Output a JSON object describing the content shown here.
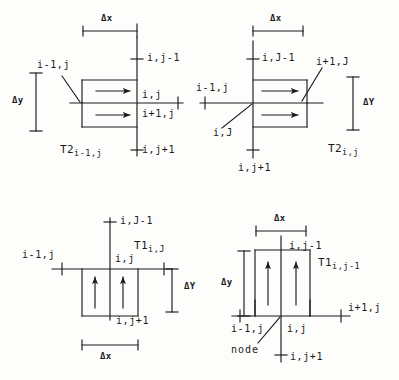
{
  "figure": {
    "ink_color": "#1a1a1a",
    "background_color": "#fdfdfc",
    "symbols": {
      "delta_x": "Δx",
      "delta_y": "Δy",
      "delta_y_upper": "ΔY"
    }
  },
  "panels": {
    "top_left": {
      "name": "T2 i-1,j control volume",
      "dim_x_label": "Δx",
      "dim_y_label": "Δy",
      "transmissibility": {
        "base": "T2",
        "subscript": "i-1,j"
      },
      "nodes": {
        "top": "i,j-1",
        "center": "i,j",
        "below_center": "i+1,j",
        "bottom": "i,j+1",
        "left_leader": "i-1,j"
      },
      "flux_arrows": 2,
      "flux_direction": "right"
    },
    "top_right": {
      "name": "T2 i,j control volume",
      "dim_x_label": "Δx",
      "dim_y_label": "ΔY",
      "transmissibility": {
        "base": "T2",
        "subscript": "i,j"
      },
      "nodes": {
        "top": "i,J-1",
        "left": "i-1,j",
        "center_leader": "i,J",
        "right_leader": "i+1,J",
        "bottom": "i,j+1"
      },
      "flux_arrows": 2,
      "flux_direction": "right"
    },
    "bottom_left": {
      "name": "T1 i,j control volume",
      "dim_x_label": "Δx",
      "dim_y_label": "ΔY",
      "transmissibility": {
        "base": "T1",
        "subscript": "i,J"
      },
      "nodes": {
        "top": "i,J-1",
        "left": "i-1,j",
        "center": "i,j",
        "bottom": "i,j+1"
      },
      "flux_arrows": 2,
      "flux_direction": "up"
    },
    "bottom_right": {
      "name": "T1 i,j-1 control volume",
      "dim_x_label": "Δx",
      "dim_y_label": "Δy",
      "transmissibility": {
        "base": "T1",
        "subscript": "i,j-1"
      },
      "nodes": {
        "top": "i,j-1",
        "left": "i-1,j",
        "right": "i+1,j",
        "center": "i,j",
        "bottom": "i,j+1",
        "annotation": "node"
      },
      "flux_arrows": 2,
      "flux_direction": "up"
    }
  }
}
